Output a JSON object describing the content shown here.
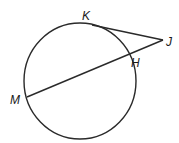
{
  "diagram": {
    "type": "circle-tangent-secant",
    "circle": {
      "cx": 80,
      "cy": 81,
      "rx": 56,
      "ry": 58,
      "stroke": "#2a2a2a"
    },
    "points": {
      "K": {
        "label": "K",
        "x": 92,
        "y": 25,
        "lx": 82,
        "ly": 20
      },
      "J": {
        "label": "J",
        "x": 163,
        "y": 40,
        "lx": 166,
        "ly": 46
      },
      "H": {
        "label": "H",
        "x": 128,
        "y": 54,
        "lx": 131,
        "ly": 67
      },
      "M": {
        "label": "M",
        "x": 27,
        "y": 97,
        "lx": 10,
        "ly": 104
      }
    },
    "segments": [
      {
        "name": "tangent-KJ",
        "from": "K",
        "to": "J"
      },
      {
        "name": "secant-MJ",
        "from": "M",
        "to": "J"
      }
    ],
    "line_color": "#2a2a2a"
  }
}
